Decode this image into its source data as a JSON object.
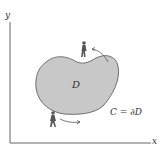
{
  "diagram": {
    "axes": {
      "x_label": "x",
      "y_label": "y"
    },
    "region_label": "D",
    "boundary_label": "C = ∂D",
    "region_fill": "#c8c8c8",
    "region_stroke": "#6f6f6f",
    "walkers": [
      {
        "name": "walker-top",
        "position": "top of region",
        "direction": "counterclockwise"
      },
      {
        "name": "walker-bottom",
        "position": "bottom of region",
        "direction": "counterclockwise"
      }
    ]
  }
}
